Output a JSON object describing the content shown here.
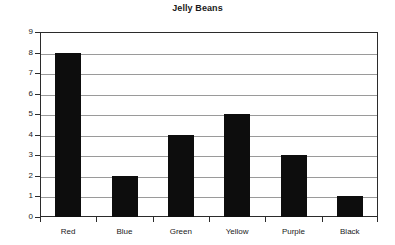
{
  "chart_data": {
    "type": "bar",
    "title": "Jelly Beans",
    "xlabel": "",
    "ylabel": "Count",
    "categories": [
      "Red",
      "Blue",
      "Green",
      "Yellow",
      "Purple",
      "Black"
    ],
    "values": [
      8,
      2,
      4,
      5,
      3,
      1
    ],
    "ylim": [
      0,
      9
    ],
    "ytick_labels": [
      "0",
      "1",
      "2",
      "3",
      "4",
      "5",
      "6",
      "7",
      "8",
      "9"
    ],
    "ytick_values": [
      0,
      1,
      2,
      3,
      4,
      5,
      6,
      7,
      8,
      9
    ],
    "grid": "horizontal",
    "legend": "none",
    "bar_color": "#0d0d0d",
    "gridline_color": "#9a9a9a",
    "axis_color": "#2b2b2b",
    "background_color": "#ffffff"
  }
}
